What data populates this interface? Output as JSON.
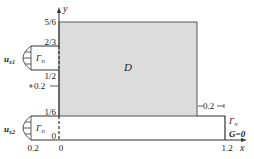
{
  "diagram": {
    "axes": {
      "x_label": "x",
      "y_label": "y"
    },
    "y_ticks": [
      "5/6",
      "2/3",
      "1/2",
      "1/6",
      "0"
    ],
    "x_ticks": [
      "0.2",
      "0",
      "1.2"
    ],
    "domain_label": "D",
    "inlet_upper": {
      "velocity_label": "u",
      "velocity_sub": "x1",
      "boundary_label": "Γ",
      "boundary_sub": "D"
    },
    "inlet_lower": {
      "velocity_label": "u",
      "velocity_sub": "x2",
      "boundary_label": "Γ",
      "boundary_sub": "D"
    },
    "outlet": {
      "boundary_label": "Γ",
      "boundary_sub": "N",
      "condition": "G=0"
    },
    "dimensions": {
      "gap_left": "0.2",
      "gap_right": "0.2"
    },
    "colors": {
      "domain_fill": "#d9d9d9",
      "line": "#333333"
    }
  }
}
